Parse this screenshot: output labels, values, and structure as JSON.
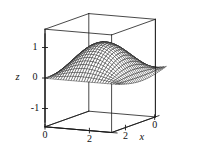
{
  "figure": {
    "kind": "surface-mesh-3d",
    "background_color": "#ffffff",
    "line_color": "#222222",
    "frame_color": "#1a1a1a"
  },
  "chart_data": {
    "type": "line",
    "plot_style": "3d-wireframe-surface",
    "title": "",
    "subtitle": "",
    "xlabel": "x",
    "ylabel": "y",
    "zlabel": "z",
    "xlim": [
      0,
      3
    ],
    "ylim": [
      0,
      3
    ],
    "zlim": [
      -1.6,
      1.6
    ],
    "xticks": [
      2,
      0
    ],
    "xtick_labels": [
      "2",
      "0"
    ],
    "yticks": [
      0,
      2
    ],
    "ytick_labels": [
      "0",
      "2"
    ],
    "zticks": [
      1,
      0,
      -1
    ],
    "ztick_labels": [
      "1",
      "0",
      "-1"
    ],
    "grid": false,
    "legend": "none",
    "surface": {
      "expression": "sin(x)*sin(y)",
      "description": "saddle-like trigonometric surface with peaks at box corners",
      "u_divisions": 28,
      "v_divisions": 28,
      "x_start": 0,
      "x_end": 3.3,
      "y_start": 0,
      "y_end": 3.3
    },
    "view": {
      "azimuth_deg": 35,
      "elevation_deg": 22
    },
    "annotations": []
  },
  "axes": {
    "z": {
      "label": "z",
      "ticks": [
        {
          "label": "1",
          "value": 1
        },
        {
          "label": "0",
          "value": 0
        },
        {
          "label": "-1",
          "value": -1
        }
      ]
    },
    "y": {
      "label": "y",
      "ticks": [
        {
          "label": "0",
          "value": 0
        },
        {
          "label": "2",
          "value": 2
        }
      ]
    },
    "x": {
      "label": "x",
      "ticks": [
        {
          "label": "2",
          "value": 2
        },
        {
          "label": "0",
          "value": 0
        }
      ]
    }
  }
}
